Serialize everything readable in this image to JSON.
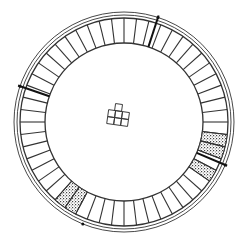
{
  "diagram": {
    "title": "",
    "type": "circular-plan",
    "center": [
      124,
      122
    ],
    "colors": {
      "line": "#333333",
      "background": "#ffffff",
      "hatch": "#555555"
    },
    "rings": {
      "outer_double": [
        110,
        107
      ],
      "band_outer": 104,
      "band_inner": 79
    },
    "segments": {
      "count": 52,
      "start_angle_deg": -90,
      "bold_spokes_deg": [
        -72,
        199,
        23
      ],
      "hatched_cells": [
        14,
        15,
        17,
        30,
        31
      ]
    },
    "markers_deg": [
      -72,
      199,
      23,
      112
    ],
    "center_grid": {
      "cells": [
        {
          "x": 114,
          "y": 104
        },
        {
          "x": 108,
          "y": 111
        },
        {
          "x": 115,
          "y": 111
        },
        {
          "x": 122,
          "y": 111
        },
        {
          "x": 108,
          "y": 118
        },
        {
          "x": 115,
          "y": 118
        },
        {
          "x": 122,
          "y": 118
        }
      ],
      "cell_size": 7,
      "rotation_deg": 8
    }
  }
}
